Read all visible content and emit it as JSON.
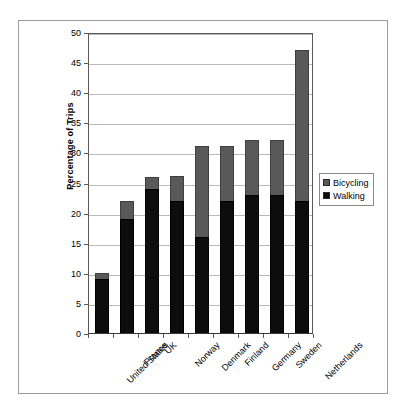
{
  "chart_data": {
    "type": "bar",
    "subtype": "stacked-vertical-bar",
    "title": "",
    "xlabel": "",
    "ylabel": "Percentage of Trips",
    "ylim": [
      0,
      50
    ],
    "ytick_step": 5,
    "yticks": [
      0,
      5,
      10,
      15,
      20,
      25,
      30,
      35,
      40,
      45,
      50
    ],
    "grid": "horizontal",
    "legend_position": "right",
    "categories": [
      "United States",
      "France",
      "UK",
      "Norway",
      "Denmark",
      "Finland",
      "Germany",
      "Sweden",
      "Netherlands"
    ],
    "series": [
      {
        "name": "Walking",
        "color": "#0d0d0d",
        "stack_order": 0,
        "values": [
          9,
          19,
          24,
          22,
          16,
          22,
          23,
          23,
          22
        ]
      },
      {
        "name": "Bicycling",
        "color": "#595959",
        "stack_order": 1,
        "values": [
          1,
          3,
          2,
          4,
          15,
          9,
          9,
          9,
          25
        ]
      }
    ],
    "totals": [
      10,
      22,
      26,
      26,
      31,
      31,
      32,
      32,
      47
    ]
  },
  "legend": {
    "entries": [
      {
        "label": "Bicycling",
        "color": "#595959"
      },
      {
        "label": "Walking",
        "color": "#0d0d0d"
      }
    ]
  },
  "colors": {
    "bicycling": "#595959",
    "walking": "#0d0d0d",
    "gridline": "#b9b9b9",
    "axis": "#5a5a5a",
    "frame": "#9a9a9a",
    "background": "#ffffff"
  }
}
